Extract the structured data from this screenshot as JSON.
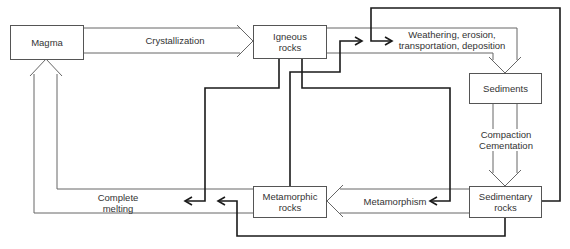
{
  "nodes": {
    "magma": "Magma",
    "igneous": "Igneous\nrocks",
    "sediments": "Sediments",
    "sedimentary": "Sedimentary\nrocks",
    "metamorphic": "Metamorphic\nrocks"
  },
  "processes": {
    "crystallization": "Crystallization",
    "weathering": "Weathering, erosion,\ntransportation, deposition",
    "compaction": "Compaction\nCementation",
    "metamorphism": "Metamorphism",
    "melting": "Complete\nmelting"
  },
  "colors": {
    "thin_line": "#666666",
    "thick_line": "#1a1a1a",
    "box_border": "#555555",
    "text": "#333333",
    "background": "#ffffff"
  }
}
